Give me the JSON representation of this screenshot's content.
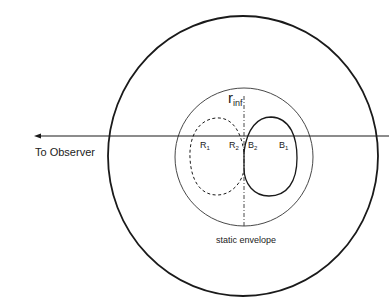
{
  "diagram": {
    "labels": {
      "observer": "To Observer",
      "radius": "r",
      "radius_subscript": "inf",
      "envelope": "static envelope"
    },
    "points": [
      {
        "letter": "R",
        "sub": "1"
      },
      {
        "letter": "R",
        "sub": "2"
      },
      {
        "letter": "B",
        "sub": "2"
      },
      {
        "letter": "B",
        "sub": "1"
      }
    ],
    "colors": {
      "line": "#1a1a1a",
      "thin": "#333333"
    }
  }
}
